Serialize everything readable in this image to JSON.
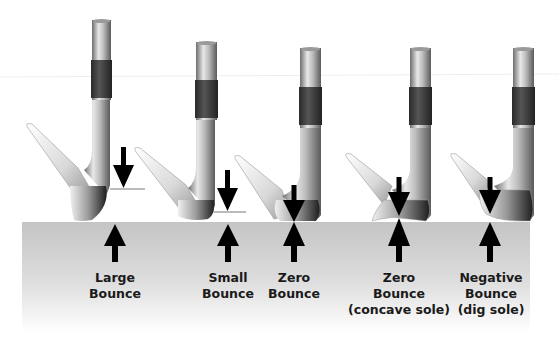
{
  "diagram": {
    "colors": {
      "ground_top": "#c4c4c4",
      "ground_bottom": "#ffffff",
      "grip_band": "#3a3a3a",
      "arrow": "#000000",
      "reference_line": "#555555"
    },
    "clubs": [
      {
        "id": "large-bounce",
        "label_lines": [
          "Large",
          "Bounce"
        ],
        "arrow_x": 115
      },
      {
        "id": "small-bounce",
        "label_lines": [
          "Small",
          "Bounce"
        ],
        "arrow_x": 228
      },
      {
        "id": "zero-bounce",
        "label_lines": [
          "Zero",
          "Bounce"
        ],
        "arrow_x": 294
      },
      {
        "id": "zero-bounce-concave",
        "label_lines": [
          "Zero",
          "Bounce",
          "(concave sole)"
        ],
        "arrow_x": 399
      },
      {
        "id": "negative-bounce",
        "label_lines": [
          "Negative",
          "Bounce",
          "(dig sole)"
        ],
        "arrow_x": 490
      }
    ]
  }
}
